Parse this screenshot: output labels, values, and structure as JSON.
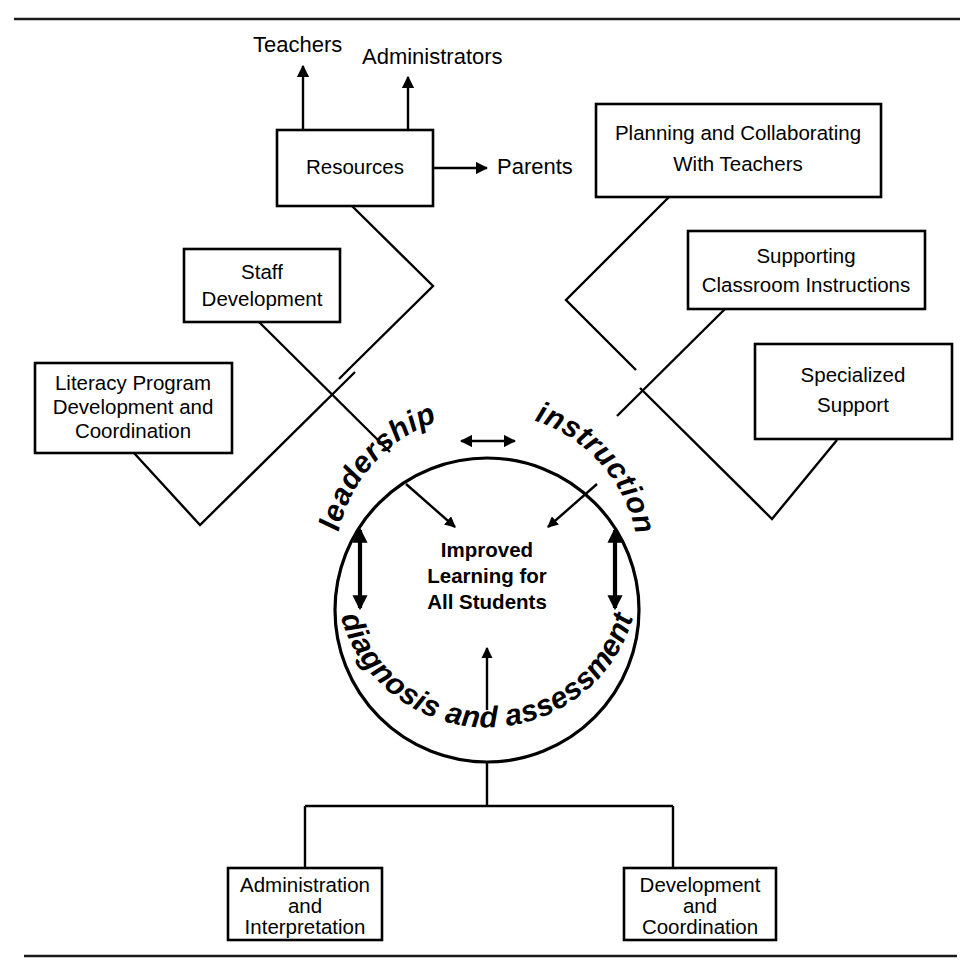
{
  "diagram": {
    "stroke_color": "#000000",
    "background_color": "#ffffff",
    "top_rule_label": "top-divider-rule",
    "bottom_rule_label": "bottom-divider-rule",
    "center": {
      "ring_top_left": "leadership",
      "ring_top_right": "instruction",
      "ring_bottom": "diagnosis and assessment",
      "core_line1": "Improved",
      "core_line2": "Learning for",
      "core_line3": "All Students"
    },
    "external_labels": [
      {
        "id": "teachers",
        "text": "Teachers"
      },
      {
        "id": "administrators",
        "text": "Administrators"
      },
      {
        "id": "parents",
        "text": "Parents"
      }
    ],
    "boxes": [
      {
        "id": "resources",
        "lines": [
          "Resources"
        ]
      },
      {
        "id": "planning-collaborating",
        "lines": [
          "Planning and Collaborating",
          "With Teachers"
        ]
      },
      {
        "id": "supporting-classroom",
        "lines": [
          "Supporting",
          "Classroom Instructions"
        ]
      },
      {
        "id": "specialized-support",
        "lines": [
          "Specialized",
          "Support"
        ]
      },
      {
        "id": "staff-development",
        "lines": [
          "Staff",
          "Development"
        ]
      },
      {
        "id": "literacy-program",
        "lines": [
          "Literacy Program",
          "Development and",
          "Coordination"
        ]
      },
      {
        "id": "administration-interpretation",
        "lines": [
          "Administration",
          "and",
          "Interpretation"
        ]
      },
      {
        "id": "development-coordination",
        "lines": [
          "Development",
          "and",
          "Coordination"
        ]
      }
    ]
  }
}
